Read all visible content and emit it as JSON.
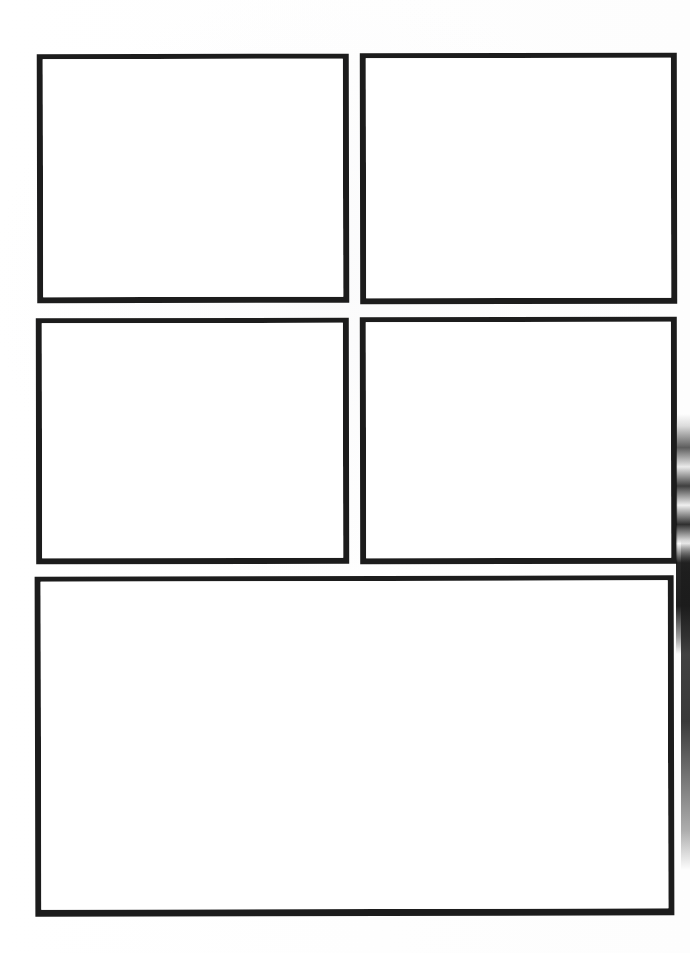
{
  "document": {
    "kind": "blank-panel-template",
    "background_color": "#ffffff",
    "border_color": "#1c1c1c",
    "width_px": 690,
    "height_px": 953
  },
  "panels": [
    {
      "id": "panel-1",
      "name": "top-left-panel",
      "content": "",
      "row": 1,
      "column": 1,
      "x": 37,
      "y": 54,
      "width": 312,
      "height": 249,
      "border_width_px": 6
    },
    {
      "id": "panel-2",
      "name": "top-right-panel",
      "content": "",
      "row": 1,
      "column": 2,
      "x": 360,
      "y": 53,
      "width": 317,
      "height": 251,
      "border_width_px": 6
    },
    {
      "id": "panel-3",
      "name": "middle-left-panel",
      "content": "",
      "row": 2,
      "column": 1,
      "x": 36,
      "y": 318,
      "width": 313,
      "height": 246,
      "border_width_px": 6
    },
    {
      "id": "panel-4",
      "name": "middle-right-panel",
      "content": "",
      "row": 2,
      "column": 2,
      "x": 360,
      "y": 317,
      "width": 317,
      "height": 247,
      "border_width_px": 6
    },
    {
      "id": "panel-5",
      "name": "bottom-wide-panel",
      "content": "",
      "row": 3,
      "column": 1,
      "x": 35,
      "y": 576,
      "width": 639,
      "height": 340,
      "border_width_px": 6
    }
  ],
  "artifacts": {
    "right_edge_scan_shadow": {
      "name": "scan-edge-artifact",
      "color": "#1a1a1a",
      "x": 676,
      "y": 414,
      "width": 14,
      "height": 456
    }
  }
}
